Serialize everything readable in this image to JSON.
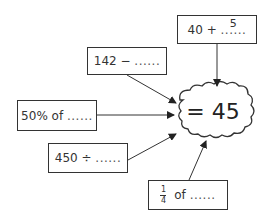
{
  "center": {
    "label": "= 45"
  },
  "boxes": [
    {
      "id": "add",
      "prefix": "40 + ",
      "blank": "......",
      "answer": "5"
    },
    {
      "id": "subtract",
      "prefix": "142 − ",
      "blank": "......"
    },
    {
      "id": "percent",
      "prefix": "50% of ",
      "blank": "......"
    },
    {
      "id": "divide",
      "prefix": "450 ÷ ",
      "blank": "......"
    },
    {
      "id": "fraction",
      "numerator": "1",
      "denominator": "4",
      "suffix": " of ",
      "blank": "......"
    }
  ],
  "colors": {
    "stroke": "#333333",
    "background": "#ffffff"
  }
}
